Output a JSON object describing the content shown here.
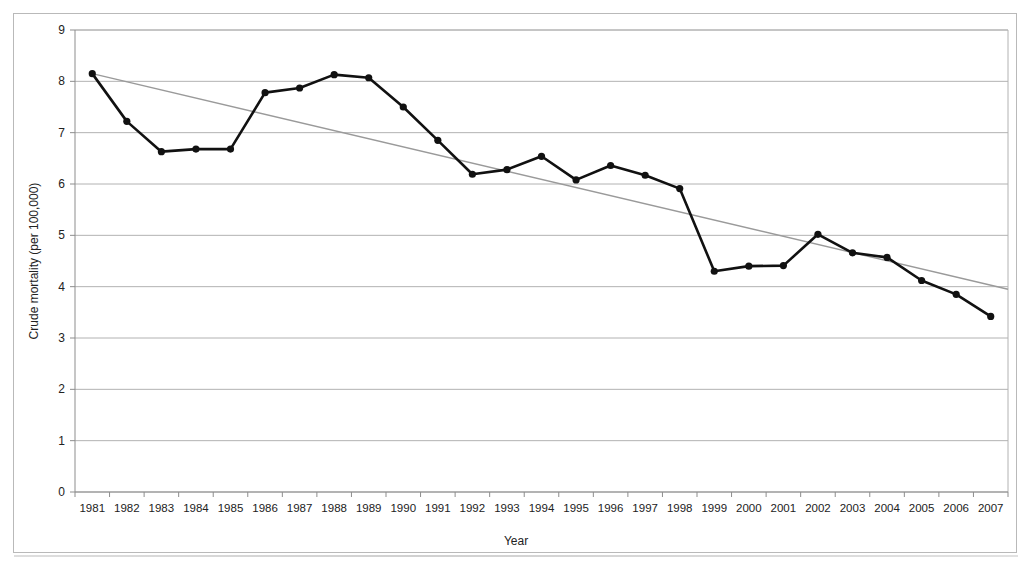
{
  "chart_data": {
    "type": "line",
    "title": "",
    "xlabel": "Year",
    "ylabel": "Crude mortality (per 100,000)",
    "xlim": [
      1981,
      2007
    ],
    "ylim": [
      0,
      9
    ],
    "grid": true,
    "legend": "none",
    "categories": [
      "1981",
      "1982",
      "1983",
      "1984",
      "1985",
      "1986",
      "1987",
      "1988",
      "1989",
      "1990",
      "1991",
      "1992",
      "1993",
      "1994",
      "1995",
      "1996",
      "1997",
      "1998",
      "1999",
      "2000",
      "2001",
      "2002",
      "2003",
      "2004",
      "2005",
      "2006",
      "2007"
    ],
    "ytick_labels": [
      "0",
      "1",
      "2",
      "3",
      "4",
      "5",
      "6",
      "7",
      "8",
      "9"
    ],
    "ytick_values": [
      0,
      1,
      2,
      3,
      4,
      5,
      6,
      7,
      8,
      9
    ],
    "series": [
      {
        "name": "Crude mortality",
        "style": "line-with-markers",
        "color": "#111111",
        "values": [
          8.15,
          7.22,
          6.63,
          6.68,
          6.68,
          7.78,
          7.87,
          8.13,
          8.07,
          7.5,
          6.85,
          6.19,
          6.28,
          6.54,
          6.08,
          6.36,
          6.17,
          5.91,
          4.3,
          4.4,
          4.41,
          5.02,
          4.66,
          4.57,
          4.12,
          3.85,
          3.42
        ]
      },
      {
        "name": "Linear trend",
        "style": "trendline",
        "color": "#9a9a9a",
        "endpoints": [
          {
            "x": 1981,
            "y": 8.15
          },
          {
            "x": 2007.5,
            "y": 3.95
          }
        ]
      }
    ],
    "colors": {
      "series": "#111111",
      "trend": "#9a9a9a",
      "grid": "#b2b2b2",
      "axis": "#8d8d8d",
      "frame": "#b9b9b9",
      "background": "#ffffff"
    }
  },
  "figure": {
    "caption_fragment": "",
    "frame_present": true
  }
}
